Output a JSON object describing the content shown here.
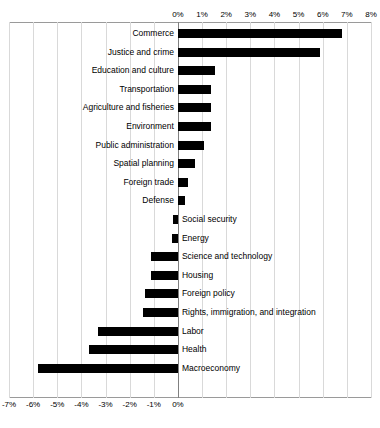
{
  "chart_data": {
    "type": "bar",
    "orientation": "horizontal",
    "title": "",
    "xlabel": "",
    "ylabel": "",
    "xlim": [
      -0.07,
      0.08
    ],
    "xticks": [
      "-7%",
      "-6%",
      "-5%",
      "-4%",
      "-3%",
      "-2%",
      "-1%",
      "0%",
      "1%",
      "2%",
      "3%",
      "4%",
      "5%",
      "6%",
      "7%",
      "8%"
    ],
    "xtick_values": [
      -0.07,
      -0.06,
      -0.05,
      -0.04,
      -0.03,
      -0.02,
      -0.01,
      0,
      0.01,
      0.02,
      0.03,
      0.04,
      0.05,
      0.06,
      0.07,
      0.08
    ],
    "axis_top_ticks": [
      "0%",
      "1%",
      "2%",
      "3%",
      "4%",
      "5%",
      "6%",
      "7%",
      "8%"
    ],
    "axis_bottom_ticks": [
      "-7%",
      "-6%",
      "-5%",
      "-4%",
      "-3%",
      "-2%",
      "-1%",
      "0%"
    ],
    "grid": true,
    "legend": false,
    "categories": [
      "Commerce",
      "Justice and crime",
      "Education and culture",
      "Transportation",
      "Agriculture and fisheries",
      "Environment",
      "Public administration",
      "Spatial planning",
      "Foreign trade",
      "Defense",
      "Social security",
      "Energy",
      "Science and technology",
      "Housing",
      "Foreign policy",
      "Rights, immigration, and integration",
      "Labor",
      "Health",
      "Macroeconomy"
    ],
    "values": [
      0.068,
      0.059,
      0.0155,
      0.0135,
      0.0135,
      0.0135,
      0.011,
      0.007,
      0.004,
      0.003,
      -0.002,
      -0.0025,
      -0.011,
      -0.011,
      -0.0135,
      -0.0145,
      -0.033,
      -0.037,
      -0.058
    ]
  }
}
